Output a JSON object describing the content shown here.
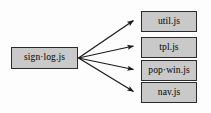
{
  "diagram": {
    "type": "directed-dependency-graph",
    "background_color": "#fdfdfd",
    "node_fill_color": "#c9c9c9",
    "node_border_color": "#2b2b2b",
    "edge_color": "#1a1a1a",
    "source_node": {
      "id": "sign-log-js",
      "label": "sign·log.js"
    },
    "target_nodes": [
      {
        "id": "util-js",
        "label": "util.js"
      },
      {
        "id": "tpl-js",
        "label": "tpl.js"
      },
      {
        "id": "pop-win-js",
        "label": "pop·win.js"
      },
      {
        "id": "nav-js",
        "label": "nav.js"
      }
    ],
    "edges": [
      {
        "from": "sign·log.js",
        "to": "util.js"
      },
      {
        "from": "sign·log.js",
        "to": "tpl.js"
      },
      {
        "from": "sign·log.js",
        "to": "pop·win.js"
      },
      {
        "from": "sign·log.js",
        "to": "nav.js"
      }
    ]
  }
}
